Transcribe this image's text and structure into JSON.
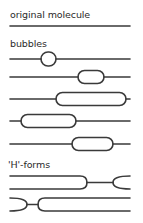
{
  "diagram": {
    "sections": [
      {
        "id": "original",
        "label": "original molecule"
      },
      {
        "id": "bubbles",
        "label": "bubbles"
      },
      {
        "id": "h_forms",
        "label": "'H'-forms"
      }
    ],
    "colors": {
      "stroke": "#3a3a3a",
      "text": "#2a2a2a",
      "background": "#ffffff"
    },
    "original_molecule": {
      "y": 26,
      "x1": 10,
      "x2": 130
    },
    "bubbles": [
      {
        "y": 59,
        "x1": 41,
        "x2": 56
      },
      {
        "y": 77,
        "x1": 78,
        "x2": 104
      },
      {
        "y": 99,
        "x1": 56,
        "x2": 127
      },
      {
        "y": 121,
        "x1": 21,
        "x2": 76
      },
      {
        "y": 144,
        "x1": 72,
        "x2": 113
      }
    ],
    "h_forms": [
      {
        "top_y": 176,
        "bottom_y": 189,
        "type": "right-junction"
      },
      {
        "top_y": 198,
        "bottom_y": 211,
        "type": "left-junction"
      }
    ]
  }
}
